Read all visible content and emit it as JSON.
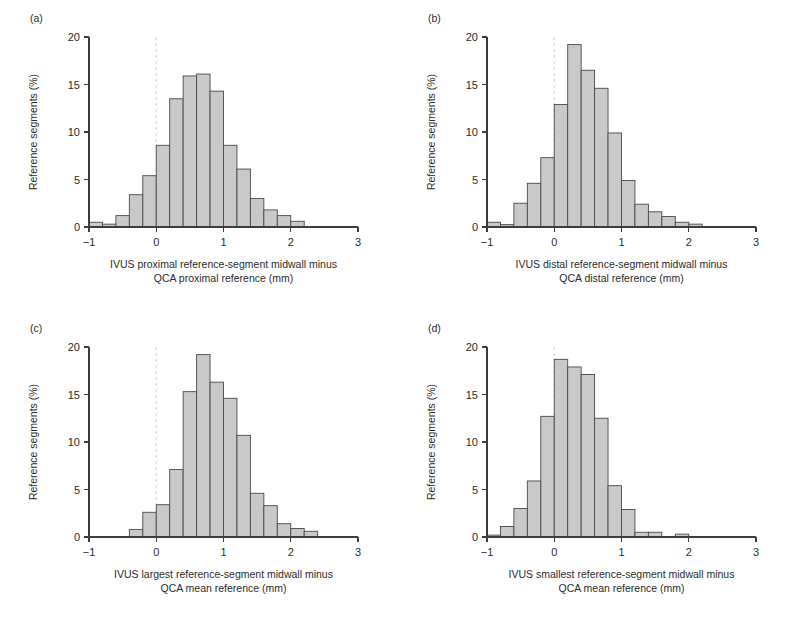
{
  "figure": {
    "background": "#ffffff",
    "bar_fill": "#c9c9c9",
    "bar_stroke": "#4a4a4a",
    "axis_color": "#3d3d3d",
    "zero_line_color": "#d9d3cb",
    "ylabel": "Reference segments (%)",
    "caption": ""
  },
  "chart_data": [
    {
      "type": "bar",
      "panel": "(a)",
      "title": "",
      "xlabel_line1": "IVUS proximal reference-segment midwall minus",
      "xlabel_line2": "QCA proximal reference (mm)",
      "ylabel": "Reference segments (%)",
      "xlim": [
        -1,
        3
      ],
      "ylim": [
        0,
        20
      ],
      "xticks": [
        -1,
        0,
        1,
        2,
        3
      ],
      "xtick_labels": [
        "−1",
        "0",
        "1",
        "2",
        "3"
      ],
      "yticks": [
        0,
        5,
        10,
        15,
        20
      ],
      "ytick_labels": [
        "0",
        "5",
        "10",
        "15",
        "20"
      ],
      "grid": false,
      "legend": false,
      "bin_width": 0.2,
      "zero_reference_line": 0,
      "bins": [
        {
          "x0": -1.0,
          "x1": -0.8,
          "value": 0.5
        },
        {
          "x0": -0.8,
          "x1": -0.6,
          "value": 0.3
        },
        {
          "x0": -0.6,
          "x1": -0.4,
          "value": 1.2
        },
        {
          "x0": -0.4,
          "x1": -0.2,
          "value": 3.4
        },
        {
          "x0": -0.2,
          "x1": 0.0,
          "value": 5.4
        },
        {
          "x0": 0.0,
          "x1": 0.2,
          "value": 8.6
        },
        {
          "x0": 0.2,
          "x1": 0.4,
          "value": 13.5
        },
        {
          "x0": 0.4,
          "x1": 0.6,
          "value": 15.9
        },
        {
          "x0": 0.6,
          "x1": 0.8,
          "value": 16.1
        },
        {
          "x0": 0.8,
          "x1": 1.0,
          "value": 14.3
        },
        {
          "x0": 1.0,
          "x1": 1.2,
          "value": 8.6
        },
        {
          "x0": 1.2,
          "x1": 1.4,
          "value": 6.1
        },
        {
          "x0": 1.4,
          "x1": 1.6,
          "value": 3.0
        },
        {
          "x0": 1.6,
          "x1": 1.8,
          "value": 1.8
        },
        {
          "x0": 1.8,
          "x1": 2.0,
          "value": 1.2
        },
        {
          "x0": 2.0,
          "x1": 2.2,
          "value": 0.6
        }
      ],
      "bin_offset": -1.0
    },
    {
      "type": "bar",
      "panel": "(b)",
      "title": "",
      "xlabel_line1": "IVUS distal reference-segment midwall minus",
      "xlabel_line2": "QCA distal reference (mm)",
      "ylabel": "Reference segments (%)",
      "xlim": [
        -1,
        3
      ],
      "ylim": [
        0,
        20
      ],
      "xticks": [
        -1,
        0,
        1,
        2,
        3
      ],
      "xtick_labels": [
        "−1",
        "0",
        "1",
        "2",
        "3"
      ],
      "yticks": [
        0,
        5,
        10,
        15,
        20
      ],
      "ytick_labels": [
        "0",
        "5",
        "10",
        "15",
        "20"
      ],
      "grid": false,
      "legend": false,
      "bin_width": 0.2,
      "zero_reference_line": 0,
      "bins": [
        {
          "x0": -1.0,
          "x1": -0.8,
          "value": 0.5
        },
        {
          "x0": -0.8,
          "x1": -0.6,
          "value": 0.25
        },
        {
          "x0": -0.6,
          "x1": -0.4,
          "value": 2.5
        },
        {
          "x0": -0.4,
          "x1": -0.2,
          "value": 4.6
        },
        {
          "x0": -0.2,
          "x1": 0.0,
          "value": 7.3
        },
        {
          "x0": 0.0,
          "x1": 0.2,
          "value": 12.9
        },
        {
          "x0": 0.2,
          "x1": 0.4,
          "value": 19.2
        },
        {
          "x0": 0.4,
          "x1": 0.6,
          "value": 16.5
        },
        {
          "x0": 0.6,
          "x1": 0.8,
          "value": 14.6
        },
        {
          "x0": 0.8,
          "x1": 1.0,
          "value": 9.9
        },
        {
          "x0": 1.0,
          "x1": 1.2,
          "value": 4.9
        },
        {
          "x0": 1.2,
          "x1": 1.4,
          "value": 2.4
        },
        {
          "x0": 1.4,
          "x1": 1.6,
          "value": 1.6
        },
        {
          "x0": 1.6,
          "x1": 1.8,
          "value": 1.1
        },
        {
          "x0": 1.8,
          "x1": 2.0,
          "value": 0.5
        },
        {
          "x0": 2.0,
          "x1": 2.2,
          "value": 0.3
        }
      ],
      "bin_offset": -1.0
    },
    {
      "type": "bar",
      "panel": "(c)",
      "title": "",
      "xlabel_line1": "IVUS largest reference-segment midwall minus",
      "xlabel_line2": "QCA mean reference (mm)",
      "ylabel": "Reference segments (%)",
      "xlim": [
        -1,
        3
      ],
      "ylim": [
        0,
        20
      ],
      "xticks": [
        -1,
        0,
        1,
        2,
        3
      ],
      "xtick_labels": [
        "−1",
        "0",
        "1",
        "2",
        "3"
      ],
      "yticks": [
        0,
        5,
        10,
        15,
        20
      ],
      "ytick_labels": [
        "0",
        "5",
        "10",
        "15",
        "20"
      ],
      "grid": false,
      "legend": false,
      "bin_width": 0.2,
      "zero_reference_line": 0,
      "bins": [
        {
          "x0": -0.4,
          "x1": -0.2,
          "value": 0.8
        },
        {
          "x0": -0.2,
          "x1": 0.0,
          "value": 2.6
        },
        {
          "x0": 0.0,
          "x1": 0.2,
          "value": 3.4
        },
        {
          "x0": 0.2,
          "x1": 0.4,
          "value": 7.1
        },
        {
          "x0": 0.4,
          "x1": 0.6,
          "value": 15.3
        },
        {
          "x0": 0.6,
          "x1": 0.8,
          "value": 19.2
        },
        {
          "x0": 0.8,
          "x1": 1.0,
          "value": 16.3
        },
        {
          "x0": 1.0,
          "x1": 1.2,
          "value": 14.6
        },
        {
          "x0": 1.2,
          "x1": 1.4,
          "value": 10.7
        },
        {
          "x0": 1.4,
          "x1": 1.6,
          "value": 4.6
        },
        {
          "x0": 1.6,
          "x1": 1.8,
          "value": 3.3
        },
        {
          "x0": 1.8,
          "x1": 2.0,
          "value": 1.4
        },
        {
          "x0": 2.0,
          "x1": 2.2,
          "value": 0.9
        },
        {
          "x0": 2.2,
          "x1": 2.4,
          "value": 0.6
        }
      ],
      "bin_offset": -0.4
    },
    {
      "type": "bar",
      "panel": "(d)",
      "title": "",
      "xlabel_line1": "IVUS smallest reference-segment midwall minus",
      "xlabel_line2": "QCA mean reference (mm)",
      "ylabel": "Reference segments (%)",
      "xlim": [
        -1,
        3
      ],
      "ylim": [
        0,
        20
      ],
      "xticks": [
        -1,
        0,
        1,
        2,
        3
      ],
      "xtick_labels": [
        "−1",
        "0",
        "1",
        "2",
        "3"
      ],
      "yticks": [
        0,
        5,
        10,
        15,
        20
      ],
      "ytick_labels": [
        "0",
        "5",
        "10",
        "15",
        "20"
      ],
      "grid": false,
      "legend": false,
      "bin_width": 0.2,
      "zero_reference_line": 0,
      "bins": [
        {
          "x0": -1.0,
          "x1": -0.8,
          "value": 0.2
        },
        {
          "x0": -0.8,
          "x1": -0.6,
          "value": 1.1
        },
        {
          "x0": -0.6,
          "x1": -0.4,
          "value": 3.0
        },
        {
          "x0": -0.4,
          "x1": -0.2,
          "value": 5.9
        },
        {
          "x0": -0.2,
          "x1": 0.0,
          "value": 12.7
        },
        {
          "x0": 0.0,
          "x1": 0.2,
          "value": 18.7
        },
        {
          "x0": 0.2,
          "x1": 0.4,
          "value": 17.9
        },
        {
          "x0": 0.4,
          "x1": 0.6,
          "value": 17.1
        },
        {
          "x0": 0.6,
          "x1": 0.8,
          "value": 12.5
        },
        {
          "x0": 0.8,
          "x1": 1.0,
          "value": 5.4
        },
        {
          "x0": 1.0,
          "x1": 1.2,
          "value": 2.9
        },
        {
          "x0": 1.2,
          "x1": 1.4,
          "value": 0.5
        },
        {
          "x0": 1.4,
          "x1": 1.6,
          "value": 0.5
        },
        {
          "x0": 1.8,
          "x1": 2.0,
          "value": 0.3
        }
      ],
      "bin_offset": -1.0
    }
  ]
}
